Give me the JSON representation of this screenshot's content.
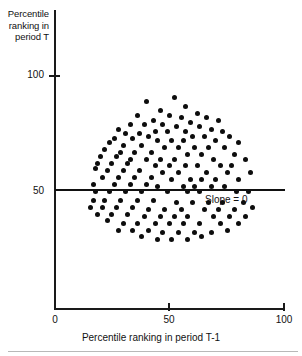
{
  "figure": {
    "name": "percentile-ranking-scatter",
    "background_color": "#ffffff",
    "ink_color": "#111111"
  },
  "axes": {
    "y_title": {
      "line1": "Percentile",
      "line2": "ranking in",
      "line3": "period T"
    },
    "x_title": "Percentile ranking in period T-1",
    "y_ticks": [
      "100",
      "50"
    ],
    "x_ticks": [
      "0",
      "50",
      "100"
    ]
  },
  "annotation": {
    "slope_label": "Slope  =  0"
  },
  "chart_data": {
    "type": "scatter",
    "title": "",
    "xlabel": "Percentile ranking in period T-1",
    "ylabel": "Percentile ranking in period T",
    "xlim": [
      0,
      100
    ],
    "ylim": [
      0,
      130
    ],
    "xticks": [
      0,
      50,
      100
    ],
    "yticks": [
      50,
      100
    ],
    "grid": false,
    "legend": null,
    "marker": "circle",
    "marker_color": "#0d0d0d",
    "marker_size_px": 5,
    "reference_line": {
      "label": "Slope  =  0",
      "type": "horizontal",
      "y": 50,
      "slope": 0,
      "color": "#111111"
    },
    "n_points": 148,
    "points": [
      [
        40,
        90
      ],
      [
        52,
        92
      ],
      [
        57,
        88
      ],
      [
        46,
        86
      ],
      [
        62,
        85
      ],
      [
        36,
        84
      ],
      [
        50,
        84
      ],
      [
        55,
        83
      ],
      [
        66,
        83
      ],
      [
        43,
        82
      ],
      [
        59,
        81
      ],
      [
        71,
        82
      ],
      [
        33,
        80
      ],
      [
        39,
        80
      ],
      [
        47,
        80
      ],
      [
        53,
        79
      ],
      [
        63,
        79
      ],
      [
        68,
        78
      ],
      [
        28,
        78
      ],
      [
        44,
        77
      ],
      [
        49,
        77
      ],
      [
        57,
        77
      ],
      [
        73,
        77
      ],
      [
        31,
        76
      ],
      [
        37,
        76
      ],
      [
        41,
        75
      ],
      [
        60,
        75
      ],
      [
        65,
        75
      ],
      [
        76,
        75
      ],
      [
        26,
        74
      ],
      [
        34,
        74
      ],
      [
        45,
        73
      ],
      [
        51,
        73
      ],
      [
        56,
        73
      ],
      [
        70,
        73
      ],
      [
        80,
        72
      ],
      [
        24,
        72
      ],
      [
        30,
        71
      ],
      [
        38,
        71
      ],
      [
        48,
        70
      ],
      [
        54,
        70
      ],
      [
        61,
        70
      ],
      [
        67,
        70
      ],
      [
        74,
        70
      ],
      [
        22,
        69
      ],
      [
        29,
        68
      ],
      [
        35,
        68
      ],
      [
        42,
        68
      ],
      [
        58,
        67
      ],
      [
        64,
        67
      ],
      [
        78,
        67
      ],
      [
        20,
        66
      ],
      [
        27,
        66
      ],
      [
        33,
        65
      ],
      [
        40,
        65
      ],
      [
        46,
        65
      ],
      [
        52,
        65
      ],
      [
        69,
        65
      ],
      [
        83,
        65
      ],
      [
        19,
        63
      ],
      [
        25,
        63
      ],
      [
        32,
        63
      ],
      [
        44,
        62
      ],
      [
        50,
        62
      ],
      [
        57,
        62
      ],
      [
        62,
        62
      ],
      [
        72,
        62
      ],
      [
        77,
        62
      ],
      [
        18,
        61
      ],
      [
        23,
        60
      ],
      [
        30,
        60
      ],
      [
        37,
        60
      ],
      [
        47,
        59
      ],
      [
        54,
        59
      ],
      [
        66,
        59
      ],
      [
        75,
        59
      ],
      [
        85,
        59
      ],
      [
        21,
        57
      ],
      [
        28,
        57
      ],
      [
        35,
        57
      ],
      [
        42,
        57
      ],
      [
        51,
        56
      ],
      [
        59,
        56
      ],
      [
        64,
        56
      ],
      [
        70,
        56
      ],
      [
        80,
        56
      ],
      [
        17,
        54
      ],
      [
        26,
        54
      ],
      [
        33,
        54
      ],
      [
        40,
        54
      ],
      [
        45,
        53
      ],
      [
        56,
        53
      ],
      [
        61,
        53
      ],
      [
        68,
        53
      ],
      [
        74,
        53
      ],
      [
        18,
        51
      ],
      [
        24,
        51
      ],
      [
        31,
        51
      ],
      [
        38,
        51
      ],
      [
        49,
        51
      ],
      [
        58,
        51
      ],
      [
        63,
        51
      ],
      [
        79,
        51
      ],
      [
        84,
        51
      ],
      [
        17,
        47
      ],
      [
        22,
        47
      ],
      [
        29,
        47
      ],
      [
        36,
        47
      ],
      [
        43,
        47
      ],
      [
        53,
        46
      ],
      [
        60,
        46
      ],
      [
        67,
        46
      ],
      [
        73,
        46
      ],
      [
        82,
        46
      ],
      [
        16,
        44
      ],
      [
        21,
        44
      ],
      [
        27,
        44
      ],
      [
        34,
        44
      ],
      [
        41,
        43
      ],
      [
        48,
        43
      ],
      [
        55,
        43
      ],
      [
        65,
        43
      ],
      [
        71,
        43
      ],
      [
        78,
        43
      ],
      [
        86,
        44
      ],
      [
        19,
        41
      ],
      [
        25,
        41
      ],
      [
        32,
        41
      ],
      [
        39,
        40
      ],
      [
        46,
        40
      ],
      [
        52,
        40
      ],
      [
        58,
        40
      ],
      [
        69,
        40
      ],
      [
        76,
        40
      ],
      [
        83,
        40
      ],
      [
        23,
        38
      ],
      [
        30,
        37
      ],
      [
        36,
        37
      ],
      [
        44,
        37
      ],
      [
        50,
        37
      ],
      [
        56,
        37
      ],
      [
        63,
        37
      ],
      [
        72,
        37
      ],
      [
        80,
        37
      ],
      [
        28,
        34
      ],
      [
        34,
        34
      ],
      [
        41,
        34
      ],
      [
        47,
        33
      ],
      [
        54,
        33
      ],
      [
        61,
        33
      ],
      [
        68,
        33
      ],
      [
        75,
        34
      ],
      [
        38,
        31
      ],
      [
        45,
        30
      ],
      [
        51,
        30
      ],
      [
        58,
        30
      ],
      [
        64,
        31
      ]
    ]
  }
}
